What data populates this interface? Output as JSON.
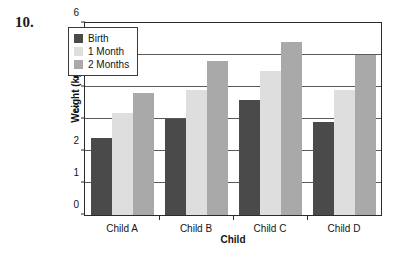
{
  "problem": {
    "number": "10."
  },
  "chart_data": {
    "type": "bar",
    "title": "",
    "xlabel": "Child",
    "ylabel": "Weight (kg)",
    "categories": [
      "Child A",
      "Child B",
      "Child C",
      "Child D"
    ],
    "series": [
      {
        "name": "Birth",
        "color": "#4a4a4a",
        "values": [
          2.4,
          3.0,
          3.6,
          2.9
        ]
      },
      {
        "name": "1 Month",
        "color": "#dedede",
        "values": [
          3.2,
          3.9,
          4.5,
          3.9
        ]
      },
      {
        "name": "2 Months",
        "color": "#a9a9a9",
        "values": [
          3.8,
          4.8,
          5.4,
          5.0
        ]
      }
    ],
    "ylim": [
      0,
      6
    ],
    "yticks": [
      0,
      1,
      2,
      3,
      4,
      5,
      6
    ],
    "ytick_labels": [
      "0",
      "1",
      "2",
      "3",
      "4",
      "5",
      "6"
    ],
    "grid": true,
    "legend_position": "top-left"
  },
  "colors": {
    "axis": "#2b2b2b",
    "gridline": "#5a5a5a",
    "text": "#141414",
    "background": "#ffffff"
  }
}
